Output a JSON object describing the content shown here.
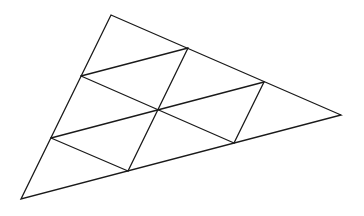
{
  "diagram": {
    "subdivisions_per_side": 3,
    "small_triangle_count": 9,
    "line_color": "#1a1a1a",
    "background_color": "#ffffff"
  }
}
